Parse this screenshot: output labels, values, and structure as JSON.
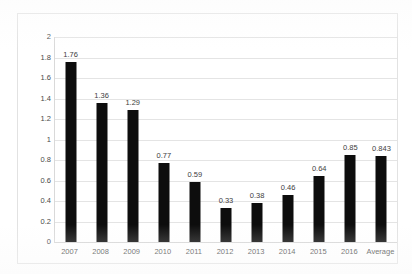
{
  "chart_data": {
    "type": "bar",
    "title": "",
    "subtitle": "",
    "xlabel": "",
    "ylabel": "",
    "categories": [
      "2007",
      "2008",
      "2009",
      "2010",
      "2011",
      "2012",
      "2013",
      "2014",
      "2015",
      "2016",
      "Average"
    ],
    "values": [
      1.76,
      1.36,
      1.29,
      0.77,
      0.59,
      0.33,
      0.38,
      0.46,
      0.64,
      0.85,
      0.843
    ],
    "data_labels": [
      "1.76",
      "1.36",
      "1.29",
      "0.77",
      "0.59",
      "0.33",
      "0.38",
      "0.46",
      "0.64",
      "0.85",
      "0.843"
    ],
    "ylim": [
      0,
      2
    ],
    "ytick_step": 0.2,
    "ytick_labels": [
      "0",
      "0.2",
      "0.4",
      "0.6",
      "0.8",
      "1",
      "1.2",
      "1.4",
      "1.6",
      "1.8",
      "2"
    ],
    "ytick_values": [
      0,
      0.2,
      0.4,
      0.6,
      0.8,
      1,
      1.2,
      1.4,
      1.6,
      1.8,
      2
    ],
    "grid": "horizontal",
    "legend": "none",
    "legend_position": "none",
    "series": [
      {
        "name": "",
        "values": [
          1.76,
          1.36,
          1.29,
          0.77,
          0.59,
          0.33,
          0.38,
          0.46,
          0.64,
          0.85,
          0.843
        ]
      }
    ],
    "colors": {
      "bar": "#0d0d0d",
      "gridline": "#e4e4e4",
      "axis": "#d9d9d9",
      "frame": "#e2e2e2",
      "tick_text": "#4a4a4a",
      "label_text": "#3d3d3d",
      "background": "#ffffff"
    }
  }
}
